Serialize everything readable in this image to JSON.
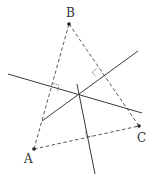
{
  "diagram": {
    "colors": {
      "line": "#3a3a3a",
      "point": "#222222",
      "label": "#333333",
      "background": "#ffffff"
    },
    "points": [
      {
        "id": "A",
        "label": "A",
        "x": 34,
        "y": 149,
        "label_x": 24,
        "label_y": 163
      },
      {
        "id": "B",
        "label": "B",
        "x": 69,
        "y": 24,
        "label_x": 66,
        "label_y": 17
      },
      {
        "id": "C",
        "label": "C",
        "x": 139,
        "y": 126,
        "label_x": 137,
        "label_y": 142
      }
    ],
    "sides": [
      {
        "from": "A",
        "to": "B",
        "style": "dashed"
      },
      {
        "from": "B",
        "to": "C",
        "style": "dashed"
      },
      {
        "from": "A",
        "to": "C",
        "style": "dashed"
      }
    ],
    "perpendicular_bisectors": [
      {
        "of": "AB",
        "x1": 8,
        "y1": 74,
        "x2": 142,
        "y2": 113
      },
      {
        "of": "BC",
        "x1": 42,
        "y1": 121,
        "x2": 138,
        "y2": 51
      },
      {
        "of": "AC",
        "x1": 77,
        "y1": 84,
        "x2": 95,
        "y2": 174
      }
    ],
    "circumcenter": {
      "x": 78,
      "y": 95
    },
    "right_angle_marks": [
      {
        "at": "midpoint-AB",
        "x": 52,
        "y": 88
      },
      {
        "at": "midpoint-BC",
        "x": 98,
        "y": 73
      },
      {
        "at": "midpoint-AC",
        "x": 88,
        "y": 133
      }
    ]
  }
}
